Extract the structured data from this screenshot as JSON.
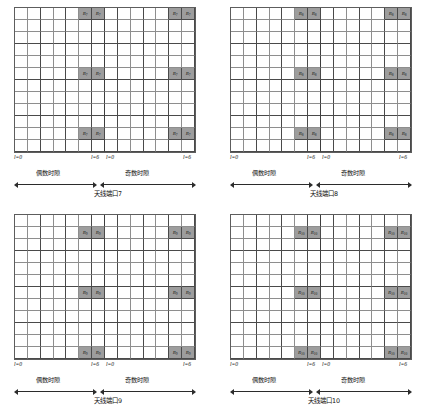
{
  "figure": {
    "grid": {
      "columns": 14,
      "rows": 12,
      "half_slot_columns": 7
    },
    "ticks": {
      "left_start": "l=0",
      "left_end": "l=6",
      "right_start": "l=0",
      "right_end": "l=6"
    },
    "slot_labels": {
      "even": "偶数时隙",
      "odd": "奇数时隙"
    }
  },
  "panels": [
    {
      "id": "port7",
      "caption": "天线端口7",
      "rs_symbol": "R",
      "rs_subscript": "7",
      "rs_rows": [
        0,
        5,
        10
      ],
      "rs_columns": [
        5,
        6,
        12,
        13
      ]
    },
    {
      "id": "port8",
      "caption": "天线端口8",
      "rs_symbol": "R",
      "rs_subscript": "8",
      "rs_rows": [
        0,
        5,
        10
      ],
      "rs_columns": [
        5,
        6,
        12,
        13
      ]
    },
    {
      "id": "port9",
      "caption": "天线端口9",
      "rs_symbol": "R",
      "rs_subscript": "9",
      "rs_rows": [
        1,
        6,
        11
      ],
      "rs_columns": [
        5,
        6,
        12,
        13
      ]
    },
    {
      "id": "port10",
      "caption": "天线端口10",
      "rs_symbol": "R",
      "rs_subscript": "10",
      "rs_rows": [
        1,
        6,
        11
      ],
      "rs_columns": [
        5,
        6,
        12,
        13
      ]
    }
  ],
  "colors": {
    "rs_fill": "#9d9d9d",
    "grid_line": "#8e8e8e",
    "border": "#5d5d5d",
    "text": "#111111",
    "background": "#ffffff"
  }
}
